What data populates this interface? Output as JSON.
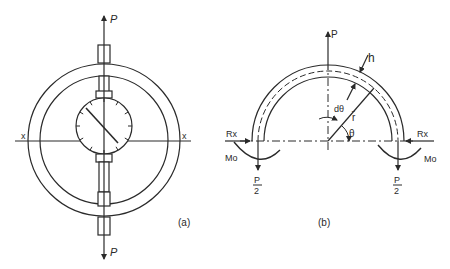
{
  "figure_a": {
    "caption": "(a)",
    "load_top": "P",
    "load_bottom": "P",
    "axis_left": "x",
    "axis_right": "x"
  },
  "figure_b": {
    "caption": "(b)",
    "load_top": "P",
    "thickness": "h",
    "angle_increment": "dθ",
    "mean_radius": "r̄",
    "angle": "θ",
    "reaction_left": "Rx",
    "reaction_right": "Rx",
    "moment_left": "Mo",
    "moment_right": "Mo",
    "half_load_left_num": "P",
    "half_load_left_den": "2",
    "half_load_right_num": "P",
    "half_load_right_den": "2"
  },
  "colors": {
    "ink": "#2a2a2a",
    "background": "#ffffff"
  }
}
